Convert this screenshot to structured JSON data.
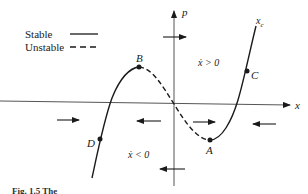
{
  "legend": {
    "stable_label": "Stable",
    "unstable_label": "Unstable"
  },
  "axes": {
    "x_label": "x",
    "y_label": "p",
    "curve_label": "x",
    "curve_label_sub": "c"
  },
  "points": {
    "A": "A",
    "B": "B",
    "C": "C",
    "D": "D"
  },
  "regions": {
    "upper": "ẋ > 0",
    "lower": "ẋ < 0"
  },
  "caption": "Fig. 1.5  The",
  "colors": {
    "ink": "#1a1a1a",
    "axis": "#555555",
    "background": "#ffffff"
  }
}
